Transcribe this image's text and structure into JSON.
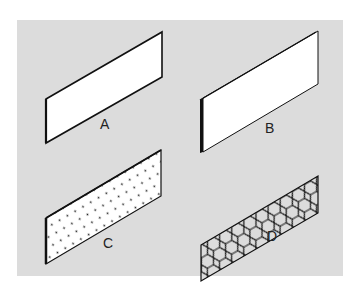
{
  "figure": {
    "background_color": "#dcdcdc",
    "panels": [
      {
        "id": "A",
        "label": "A",
        "description": "plain panel, thin edge"
      },
      {
        "id": "B",
        "label": "B",
        "description": "plain panel, thick edge"
      },
      {
        "id": "C",
        "label": "C",
        "description": "dotted/perforated panel"
      },
      {
        "id": "D",
        "label": "D",
        "description": "honeycomb mesh panel"
      }
    ]
  }
}
